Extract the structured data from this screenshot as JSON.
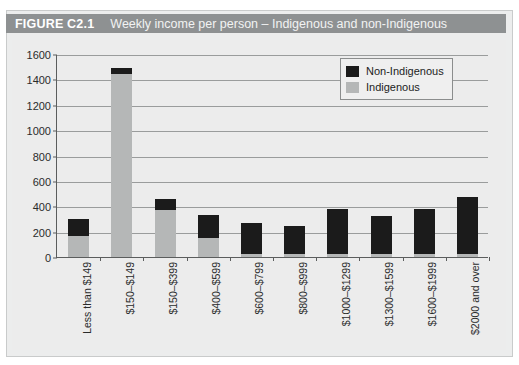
{
  "figure": {
    "number_label": "FIGURE C2.1",
    "title": "Weekly income per person – Indigenous and non-Indigenous"
  },
  "legend": {
    "position": "top-right",
    "items": [
      {
        "label": "Non-Indigenous",
        "color": "#1b1b1b",
        "swatch_name": "legend-swatch-non-indigenous"
      },
      {
        "label": "Indigenous",
        "color": "#b5b7b7",
        "swatch_name": "legend-swatch-indigenous"
      }
    ]
  },
  "chart_data": {
    "type": "bar",
    "title": "Weekly income per person – Indigenous and non-Indigenous",
    "xlabel": "",
    "ylabel": "",
    "ylim": [
      0,
      1600
    ],
    "yticks": [
      0,
      200,
      400,
      600,
      800,
      1000,
      1200,
      1400,
      1600
    ],
    "ytick_labels": [
      "0",
      "200",
      "400",
      "600",
      "800",
      "1000",
      "1200",
      "1400",
      "1600"
    ],
    "grid": true,
    "stacked": true,
    "legend_position": "upper right",
    "categories": [
      "Less than $149",
      "$150–$149",
      "$150–$399",
      "$400–$599",
      "$600–$799",
      "$800–$999",
      "$1000–$1299",
      "$1300–$1599",
      "$1600–$1999",
      "$2000 and over"
    ],
    "series": [
      {
        "name": "Indigenous",
        "color": "#b5b7b7",
        "values": [
          165,
          1440,
          370,
          150,
          25,
          25,
          25,
          25,
          25,
          25
        ]
      },
      {
        "name": "Non-Indigenous",
        "color": "#1b1b1b",
        "values": [
          135,
          50,
          85,
          180,
          240,
          220,
          350,
          295,
          350,
          445
        ]
      }
    ],
    "totals": [
      300,
      1490,
      455,
      330,
      265,
      245,
      375,
      320,
      375,
      470
    ]
  },
  "colors": {
    "banner": "#8e9192",
    "banner_text": "#ffffff",
    "card_background": "#eceded",
    "plot_background": "#ececec",
    "axis": "#5b5d5d",
    "gridline": "#9a9c9c"
  }
}
